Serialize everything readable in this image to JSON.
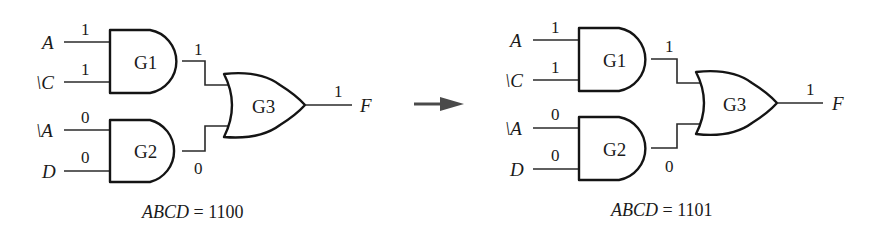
{
  "arrow": {
    "label": "transition-arrow",
    "color": "#4a4a4a"
  },
  "panels": [
    {
      "id": "left",
      "inputs": [
        {
          "name": "A",
          "value": "1"
        },
        {
          "name": "\\C",
          "value": "1"
        },
        {
          "name": "\\A",
          "value": "0"
        },
        {
          "name": "D",
          "value": "0"
        }
      ],
      "gates": {
        "g1": {
          "label": "G1",
          "type": "AND",
          "output": "1"
        },
        "g2": {
          "label": "G2",
          "type": "AND",
          "output": "0"
        },
        "g3": {
          "label": "G3",
          "type": "OR",
          "output": "1"
        }
      },
      "output": {
        "name": "F",
        "value": "1"
      },
      "caption": {
        "var": "ABCD",
        "eq": " = ",
        "value": "1100"
      }
    },
    {
      "id": "right",
      "inputs": [
        {
          "name": "A",
          "value": "1"
        },
        {
          "name": "\\C",
          "value": "1"
        },
        {
          "name": "\\A",
          "value": "0"
        },
        {
          "name": "D",
          "value": "0"
        }
      ],
      "gates": {
        "g1": {
          "label": "G1",
          "type": "AND",
          "output": "1"
        },
        "g2": {
          "label": "G2",
          "type": "AND",
          "output": "0"
        },
        "g3": {
          "label": "G3",
          "type": "OR",
          "output": "1"
        }
      },
      "output": {
        "name": "F",
        "value": "1"
      },
      "caption": {
        "var": "ABCD",
        "eq": " = ",
        "value": "1101"
      }
    }
  ]
}
